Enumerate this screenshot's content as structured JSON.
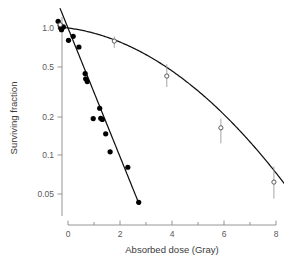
{
  "chart_data": {
    "type": "scatter",
    "title": "",
    "subtitle": "",
    "xlabel": "Absorbed dose (Gray)",
    "ylabel": "Surviving fraction",
    "xlim": [
      -0.55,
      8.45
    ],
    "ylim_log": [
      0.035,
      1.25
    ],
    "yscale": "log",
    "xscale": "linear",
    "grid": false,
    "legend": "none",
    "x_ticks": [
      0,
      2,
      4,
      6,
      8
    ],
    "x_tick_labels": [
      "0",
      "2",
      "4",
      "6",
      "8"
    ],
    "x_minor_ticks": [
      1,
      3,
      5,
      7
    ],
    "y_ticks": [
      1.0,
      0.5,
      0.2,
      0.1,
      0.05
    ],
    "y_tick_labels": [
      "1.0",
      "0.5",
      "0.2",
      "0.1",
      "0.05"
    ],
    "series": [
      {
        "name": "radiosensitive-cells",
        "marker": "filled-circle",
        "marker_color": "#000000",
        "line_color": "#111111",
        "has_error_bars": false,
        "points": [
          {
            "x": -0.38,
            "y": 1.13
          },
          {
            "x": -0.3,
            "y": 1.05
          },
          {
            "x": -0.28,
            "y": 1.0
          },
          {
            "x": -0.25,
            "y": 0.97
          },
          {
            "x": -0.18,
            "y": 1.02
          },
          {
            "x": 0.02,
            "y": 0.8
          },
          {
            "x": 0.2,
            "y": 0.86
          },
          {
            "x": 0.42,
            "y": 0.71
          },
          {
            "x": 0.66,
            "y": 0.44
          },
          {
            "x": 0.68,
            "y": 0.4
          },
          {
            "x": 0.74,
            "y": 0.38
          },
          {
            "x": 0.97,
            "y": 0.195
          },
          {
            "x": 1.22,
            "y": 0.235
          },
          {
            "x": 1.26,
            "y": 0.196
          },
          {
            "x": 1.32,
            "y": 0.192
          },
          {
            "x": 1.45,
            "y": 0.148
          },
          {
            "x": 1.62,
            "y": 0.107
          },
          {
            "x": 2.3,
            "y": 0.081
          },
          {
            "x": 2.72,
            "y": 0.043
          }
        ],
        "fit_line": {
          "type": "linear-exponential",
          "x_start": -0.3,
          "x_end": 2.74
        }
      },
      {
        "name": "radioresistant-cells",
        "marker": "open-circle",
        "marker_color": "#ffffff",
        "line_color": "#111111",
        "has_error_bars": true,
        "points": [
          {
            "x": -0.3,
            "y": 1.06,
            "err_low": 0.98,
            "err_high": 1.14
          },
          {
            "x": 1.78,
            "y": 0.79,
            "err_low": 0.7,
            "err_high": 0.86
          },
          {
            "x": 3.8,
            "y": 0.42,
            "err_low": 0.345,
            "err_high": 0.52
          },
          {
            "x": 5.88,
            "y": 0.165,
            "err_low": 0.125,
            "err_high": 0.195
          },
          {
            "x": 7.92,
            "y": 0.062,
            "err_low": 0.046,
            "err_high": 0.082
          }
        ],
        "fit_line": {
          "type": "linear-quadratic",
          "x_start": -0.32,
          "x_end": 8.42
        }
      }
    ]
  },
  "axes": {
    "x_title": "Absorbed dose (Gray)",
    "y_title": "Surviving fraction"
  },
  "colors": {
    "axis": "#8a8a8a",
    "curve": "#111111",
    "filled_marker": "#000000",
    "open_marker_stroke": "#4a4a4a",
    "error_bar": "#9a9a9a",
    "text": "#4a4a4a",
    "background": "#ffffff"
  }
}
